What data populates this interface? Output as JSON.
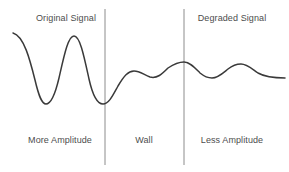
{
  "diagram": {
    "title_top_left": "Original Signal",
    "title_top_right": "Degraded Signal",
    "label_bottom_left": "More Amplitude",
    "label_bottom_center": "Wall",
    "label_bottom_right": "Less Amplitude",
    "colors": {
      "background": "#ffffff",
      "waveform": "#3a3a3a",
      "divider": "#8c8c8c",
      "text": "#4d4d4d"
    }
  },
  "chart_data": {
    "type": "line",
    "title": "",
    "xlabel": "",
    "ylabel": "",
    "grid": false,
    "legend": "none",
    "xlim": [
      0,
      289
    ],
    "ylim": [
      172,
      0
    ],
    "annotations": [
      {
        "text": "Original Signal",
        "x": 66,
        "y": 19,
        "position": "top-left-section"
      },
      {
        "text": "Degraded Signal",
        "x": 232,
        "y": 19,
        "position": "top-right-section"
      },
      {
        "text": "More Amplitude",
        "x": 60,
        "y": 141,
        "position": "bottom-left-section"
      },
      {
        "text": "Wall",
        "x": 144,
        "y": 141,
        "position": "bottom-center-section"
      },
      {
        "text": "Less Amplitude",
        "x": 232,
        "y": 141,
        "position": "bottom-right-section"
      }
    ],
    "vertical_dividers": [
      {
        "name": "wall-start",
        "x": 105,
        "y_top": 9,
        "y_bottom": 165
      },
      {
        "name": "wall-end",
        "x": 184,
        "y_top": 9,
        "y_bottom": 165
      }
    ],
    "series": [
      {
        "name": "signal",
        "path": "M 13 33 C 24 36 30 60 35 80 C 39 97 42 104 46 104 C 51 104 55 95 59 78 C 64 56 68 36 74 36 C 80 36 84 56 89 79 C 93 97 98 104 103 104 C 109 104 113 95 118 86 C 124 76 128 71 134 71 C 140 71 144 75 150 77 C 157 79 162 74 168 68 C 174 64 179 62 184 62 C 190 62 195 68 200 73 C 205 77 208 78 212 78 C 218 78 223 73 228 69 C 233 65 237 64 241 64 C 247 64 252 69 258 73 C 265 77 272 78 285 78",
        "points": [
          {
            "x": 13,
            "y": 33,
            "kind": "start"
          },
          {
            "x": 46,
            "y": 104,
            "kind": "trough"
          },
          {
            "x": 74,
            "y": 36,
            "kind": "peak"
          },
          {
            "x": 104,
            "y": 104,
            "kind": "trough"
          },
          {
            "x": 134,
            "y": 71,
            "kind": "peak"
          },
          {
            "x": 150,
            "y": 77,
            "kind": "trough"
          },
          {
            "x": 184,
            "y": 62,
            "kind": "peak"
          },
          {
            "x": 212,
            "y": 78,
            "kind": "trough"
          },
          {
            "x": 241,
            "y": 64,
            "kind": "peak"
          },
          {
            "x": 285,
            "y": 78,
            "kind": "end"
          }
        ]
      }
    ]
  }
}
